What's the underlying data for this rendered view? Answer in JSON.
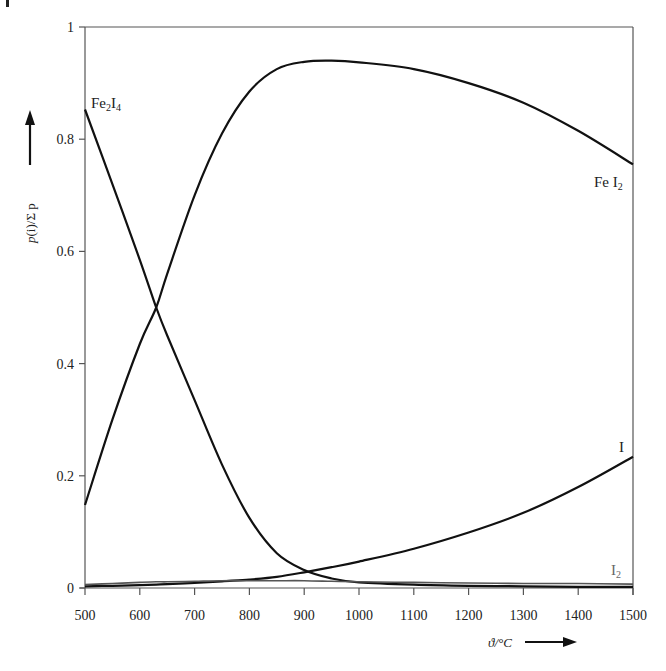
{
  "chart_data": {
    "type": "line",
    "title": "",
    "xlabel": "ϑ/°C",
    "ylabel": "p(i)/Σp",
    "xlim": [
      500,
      1500
    ],
    "ylim": [
      0,
      1
    ],
    "grid": false,
    "legend": "inline labels at curve ends",
    "x_ticks": [
      500,
      600,
      700,
      800,
      900,
      1000,
      1100,
      1200,
      1300,
      1400,
      1500
    ],
    "y_ticks": [
      0,
      0.2,
      0.4,
      0.6,
      0.8,
      1
    ],
    "y_tick_labels": [
      "0",
      "0.2",
      "0.4",
      "0.6",
      "0.8",
      "1"
    ],
    "x": [
      500,
      550,
      600,
      630,
      650,
      700,
      750,
      800,
      850,
      900,
      950,
      1000,
      1100,
      1200,
      1300,
      1400,
      1500
    ],
    "series": [
      {
        "name": "Fe2I4",
        "label": "Fe₂I₄",
        "values": [
          0.853,
          0.72,
          0.585,
          0.5,
          0.45,
          0.335,
          0.22,
          0.125,
          0.062,
          0.032,
          0.017,
          0.01,
          0.006,
          0.004,
          0.003,
          0.002,
          0.002
        ]
      },
      {
        "name": "FeI2",
        "label": "FeI₂",
        "values": [
          0.148,
          0.3,
          0.435,
          0.5,
          0.56,
          0.7,
          0.81,
          0.885,
          0.925,
          0.938,
          0.94,
          0.937,
          0.925,
          0.9,
          0.865,
          0.815,
          0.755
        ]
      },
      {
        "name": "I",
        "label": "I",
        "values": [
          0.003,
          0.004,
          0.005,
          0.006,
          0.007,
          0.009,
          0.012,
          0.015,
          0.02,
          0.028,
          0.037,
          0.047,
          0.07,
          0.099,
          0.134,
          0.18,
          0.234
        ]
      },
      {
        "name": "I2",
        "label": "I₂",
        "values": [
          0.006,
          0.008,
          0.01,
          0.011,
          0.011,
          0.012,
          0.013,
          0.013,
          0.013,
          0.013,
          0.012,
          0.011,
          0.01,
          0.009,
          0.008,
          0.008,
          0.007
        ]
      }
    ]
  },
  "labels": {
    "fe2i4": {
      "main": "Fe",
      "sub1": "2",
      "mid": "I",
      "sub2": "4"
    },
    "fei2": {
      "main": "Fe I",
      "sub": "2"
    },
    "i": {
      "main": "I"
    },
    "i2": {
      "main": "I",
      "sub": "2"
    },
    "xaxis_title": "ϑ/°C",
    "yaxis_title_p": "p",
    "yaxis_title_rest": "(i)/Σ p"
  }
}
